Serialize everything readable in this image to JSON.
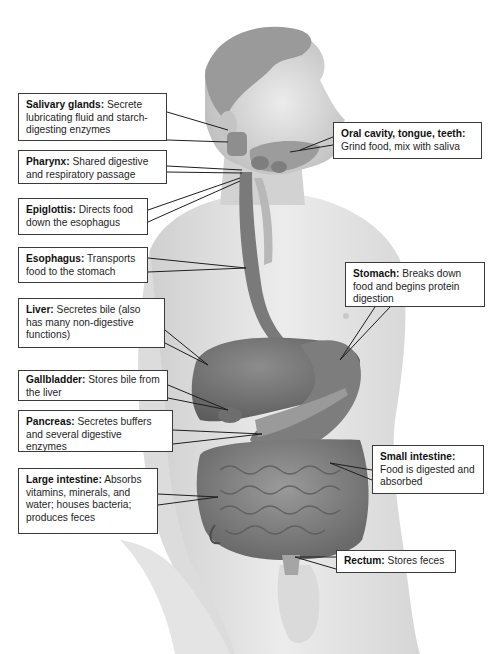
{
  "figure": {
    "colors": {
      "background": "#ffffff",
      "skin_light": "#e9e9e9",
      "skin_mid": "#cfcfcf",
      "skin_shadow": "#a9a9a9",
      "hair": "#8a8a8a",
      "organ_dark": "#6b6b6b",
      "organ_mid": "#858585",
      "organ_light": "#a0a0a0",
      "leader_line": "#1e1e1e",
      "box_border": "#3a3a3a"
    }
  },
  "labels": [
    {
      "id": "salivary-glands",
      "term": "Salivary glands:",
      "description": "Secrete lubricating fluid and starch-digesting enzymes",
      "side": "left"
    },
    {
      "id": "pharynx",
      "term": "Pharynx:",
      "description": "Shared digestive and respiratory passage",
      "side": "left"
    },
    {
      "id": "epiglottis",
      "term": "Epiglottis:",
      "description": "Directs food down the esophagus",
      "side": "left"
    },
    {
      "id": "oral-cavity",
      "term": "Oral cavity, tongue, teeth:",
      "description": "Grind food, mix with saliva",
      "side": "right"
    },
    {
      "id": "esophagus",
      "term": "Esophagus:",
      "description": "Transports food to the stomach",
      "side": "left"
    },
    {
      "id": "liver",
      "term": "Liver:",
      "description": "Secretes bile (also has many non-digestive functions)",
      "side": "left"
    },
    {
      "id": "stomach",
      "term": "Stomach:",
      "description": "Breaks down food and begins protein digestion",
      "side": "right"
    },
    {
      "id": "gallbladder",
      "term": "Gallbladder:",
      "description": "Stores bile from the liver",
      "side": "left"
    },
    {
      "id": "pancreas",
      "term": "Pancreas:",
      "description": "Secretes buffers and several digestive enzymes",
      "side": "left"
    },
    {
      "id": "small-intestine",
      "term": "Small intestine:",
      "description": "Food is digested and absorbed",
      "side": "right"
    },
    {
      "id": "large-intestine",
      "term": "Large intestine:",
      "description": "Absorbs vitamins, minerals, and water; houses bacteria; produces feces",
      "side": "left"
    },
    {
      "id": "rectum",
      "term": "Rectum:",
      "description": "Stores feces",
      "side": "right"
    }
  ]
}
